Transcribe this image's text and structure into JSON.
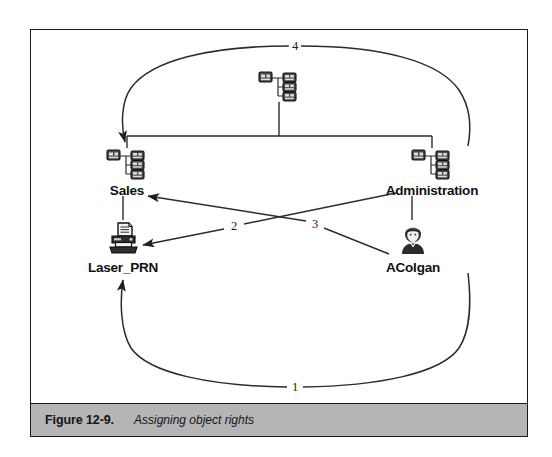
{
  "figure": {
    "caption_label": "Figure 12-9.",
    "caption_text": "Assigning object rights",
    "border_color": "#1a1a1a",
    "caption_bar_color": "#b5b5b5"
  },
  "diagram": {
    "type": "object-rights-assignment",
    "nodes": [
      {
        "id": "root-container",
        "label": "",
        "icon": "container-tree-icon",
        "x": 264,
        "y": 55
      },
      {
        "id": "sales",
        "label": "Sales",
        "icon": "container-tree-icon",
        "x": 124,
        "y": 145
      },
      {
        "id": "administration",
        "label": "Administration",
        "icon": "container-tree-icon",
        "x": 409,
        "y": 145
      },
      {
        "id": "laser-prn",
        "label": "Laser_PRN",
        "icon": "printer-icon",
        "x": 121,
        "y": 228
      },
      {
        "id": "acolgan",
        "label": "AColgan",
        "icon": "user-icon",
        "x": 411,
        "y": 228
      }
    ],
    "edges": [
      {
        "id": "edge-1",
        "number": "1",
        "from": "acolgan",
        "to": "laser-prn",
        "style": "curved",
        "arrow": "to"
      },
      {
        "id": "edge-2",
        "number": "2",
        "from": "administration",
        "to": "laser-prn",
        "style": "straight",
        "arrow": "to"
      },
      {
        "id": "edge-3",
        "number": "3",
        "from": "acolgan",
        "to": "sales",
        "style": "straight",
        "arrow": "to"
      },
      {
        "id": "edge-4",
        "number": "4",
        "from": "root-container",
        "to": "sales",
        "style": "curved",
        "arrow": "to"
      }
    ],
    "tree_links": [
      {
        "id": "tree-root-to-bus",
        "from": "root-container",
        "to": "bus"
      },
      {
        "id": "tree-bus-to-sales",
        "from": "bus",
        "to": "sales"
      },
      {
        "id": "tree-bus-to-administration",
        "from": "bus",
        "to": "administration"
      },
      {
        "id": "tree-sales-to-laser-prn",
        "from": "sales",
        "to": "laser-prn"
      },
      {
        "id": "tree-administration-to-acolgan",
        "from": "administration",
        "to": "acolgan"
      }
    ],
    "colors": {
      "line": "#2b2b2b",
      "icon_dark": "#3a3a3a",
      "icon_outline": "#111111",
      "text": "#101010"
    }
  }
}
